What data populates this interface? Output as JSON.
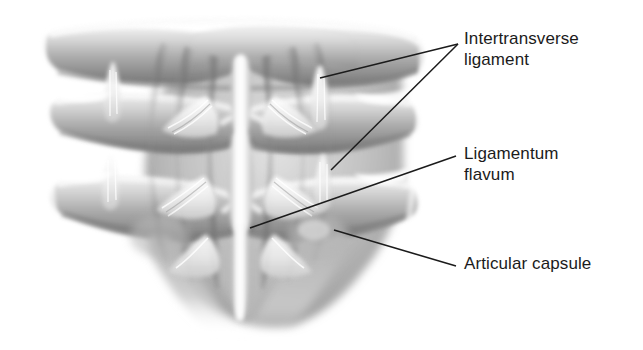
{
  "figure": {
    "name": "posterior-view-vertebral-ligaments",
    "background_color": "#ffffff",
    "ink_color": "#1b1b1b",
    "palette": {
      "highlight": "#f4f4f4",
      "light_gray": "#dcdcdc",
      "mid_gray": "#a8a8a8",
      "shadow_gray": "#7c7c7c",
      "deep_shadow": "#5e5e5e"
    }
  },
  "labels": [
    {
      "id": "intertransverse",
      "text": "Intertransverse\nligament",
      "x": 464,
      "y": 28,
      "lines": 2
    },
    {
      "id": "ligamentum_flavum",
      "text": "Ligamentum\nflavum",
      "x": 464,
      "y": 143,
      "lines": 2
    },
    {
      "id": "articular_capsule",
      "text": "Articular capsule",
      "x": 464,
      "y": 253,
      "lines": 1
    }
  ],
  "leader_lines": [
    {
      "id": "leader-intertransverse-upper",
      "from": [
        458,
        44
      ],
      "to": [
        320,
        78
      ]
    },
    {
      "id": "leader-intertransverse-lower",
      "from": [
        458,
        44
      ],
      "to": [
        331,
        170
      ]
    },
    {
      "id": "leader-ligamentum-flavum",
      "from": [
        456,
        156
      ],
      "to": [
        250,
        228
      ]
    },
    {
      "id": "leader-articular-capsule",
      "from": [
        456,
        266
      ],
      "to": [
        334,
        230
      ]
    }
  ],
  "anatomy": {
    "structures": [
      "transverse process",
      "intertransverse ligament",
      "ligamentum flavum",
      "articular capsule",
      "supraspinous ligament",
      "spinous process"
    ],
    "vertebra_rows": 3,
    "view": "posterior"
  }
}
